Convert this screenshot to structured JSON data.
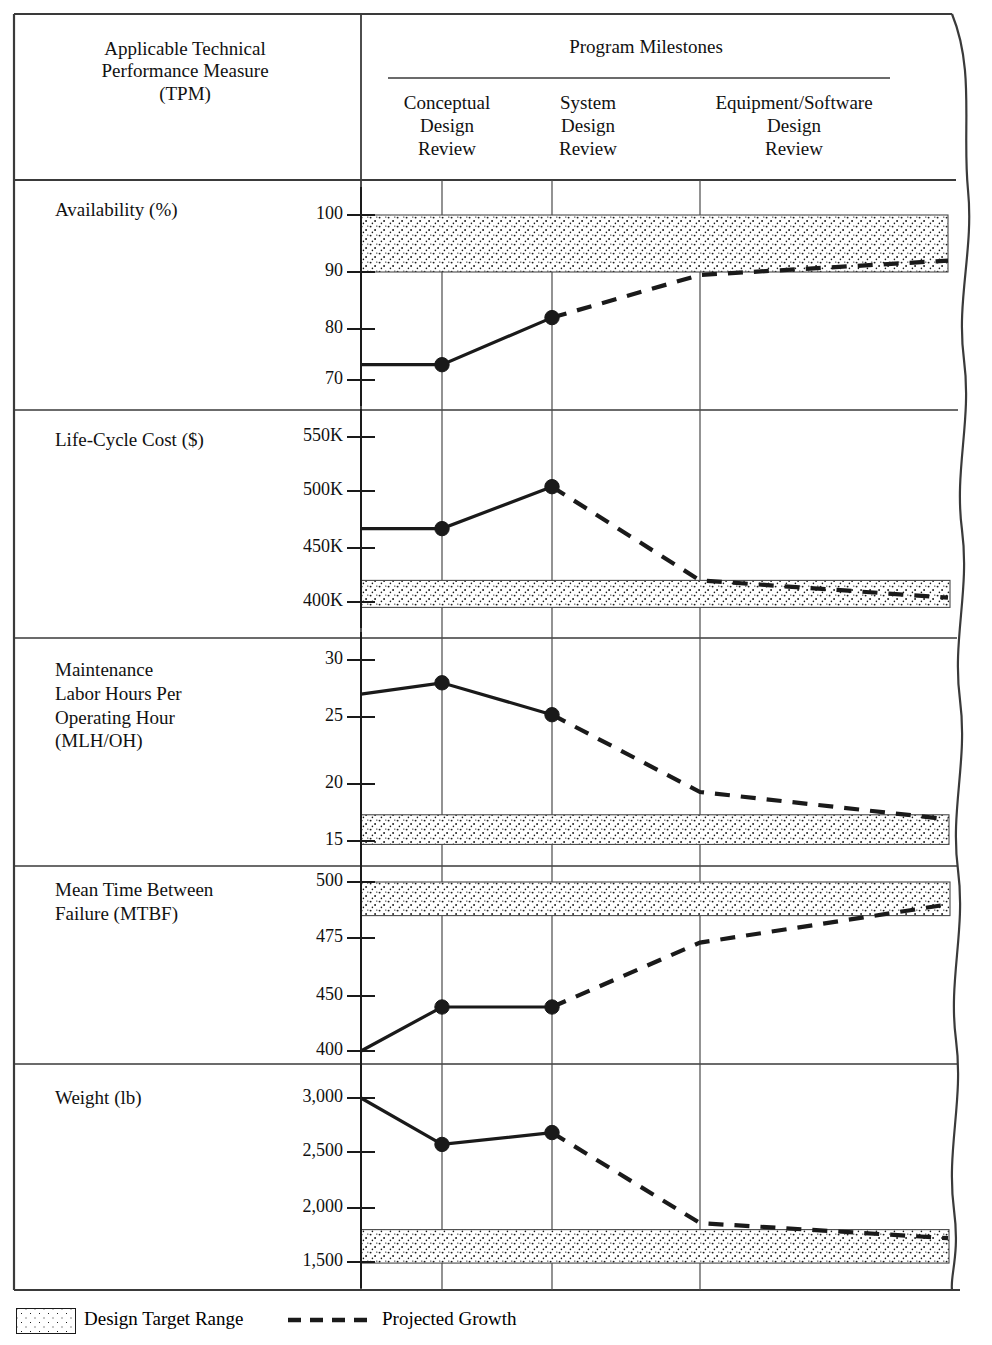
{
  "header": {
    "tpm_title": "Applicable Technical\nPerformance Measure\n(TPM)",
    "program_title": "Program Milestones",
    "milestones": [
      {
        "label": "Conceptual\nDesign\nReview",
        "short": "CDR"
      },
      {
        "label": "System\nDesign\nReview",
        "short": "SDR"
      },
      {
        "label": "Equipment/Software\nDesign\nReview",
        "short": "ESDR"
      }
    ]
  },
  "legend": {
    "target_range_label": "Design Target Range",
    "projected_growth_label": "Projected Growth",
    "swatch_icon": "stipple-swatch-icon",
    "dash_icon": "dashed-line-icon"
  },
  "colors": {
    "ink": "#1a1a1a",
    "rule": "#3a3a3a",
    "stipple": "#1a1a1a",
    "paper": "#ffffff"
  },
  "chart_data": [
    {
      "id": "availability",
      "type": "line",
      "title": "Availability (%)",
      "ylabel": "Availability (%)",
      "xlabel": "",
      "tick_labels": [
        "100",
        "90",
        "80",
        "70"
      ],
      "tick_values": [
        100,
        90,
        80,
        70
      ],
      "ylim": [
        66,
        103
      ],
      "target_range": [
        90,
        100
      ],
      "grid": true,
      "legend_position": "below-figure",
      "categories": [
        "start",
        "Conceptual Design Review",
        "System Design Review",
        "Equipment/Software Design Review",
        "end"
      ],
      "series": [
        {
          "name": "Achieved",
          "style": "solid",
          "values": [
            73,
            73,
            82,
            null,
            null
          ]
        },
        {
          "name": "Projected Growth",
          "style": "dashed",
          "values": [
            null,
            null,
            82,
            89.5,
            92
          ]
        }
      ],
      "markers_at": [
        "Conceptual Design Review",
        "System Design Review"
      ]
    },
    {
      "id": "life-cycle-cost",
      "type": "line",
      "title": "Life-Cycle Cost ($)",
      "ylabel": "Life-Cycle Cost ($)",
      "xlabel": "",
      "tick_labels": [
        "550K",
        "500K",
        "450K",
        "400K"
      ],
      "tick_values": [
        550000,
        500000,
        450000,
        400000
      ],
      "ylim": [
        385000,
        565000
      ],
      "target_range": [
        395000,
        420000
      ],
      "grid": true,
      "legend_position": "below-figure",
      "categories": [
        "start",
        "Conceptual Design Review",
        "System Design Review",
        "Equipment/Software Design Review",
        "end"
      ],
      "series": [
        {
          "name": "Achieved",
          "style": "solid",
          "values": [
            467000,
            467000,
            504000,
            null,
            null
          ]
        },
        {
          "name": "Projected Growth",
          "style": "dashed",
          "values": [
            null,
            null,
            504000,
            420000,
            404000
          ]
        }
      ],
      "markers_at": [
        "Conceptual Design Review",
        "System Design Review"
      ]
    },
    {
      "id": "maintenance-labor-hours",
      "type": "line",
      "title": "Maintenance Labor Hours Per Operating Hour (MLH/OH)",
      "ylabel": "Maintenance\nLabor Hours Per\nOperating Hour\n(MLH/OH)",
      "xlabel": "",
      "tick_labels": [
        "30",
        "25",
        "20",
        "15"
      ],
      "tick_values": [
        30,
        25,
        20,
        15
      ],
      "ylim": [
        13.5,
        31.5
      ],
      "target_range": [
        14.7,
        17.3
      ],
      "grid": true,
      "legend_position": "below-figure",
      "categories": [
        "start",
        "Conceptual Design Review",
        "System Design Review",
        "Equipment/Software Design Review",
        "end"
      ],
      "series": [
        {
          "name": "Achieved",
          "style": "solid",
          "values": [
            27.0,
            28.0,
            25.2,
            null,
            null
          ]
        },
        {
          "name": "Projected Growth",
          "style": "dashed",
          "values": [
            null,
            null,
            25.2,
            19.3,
            16.9
          ]
        }
      ],
      "markers_at": [
        "Conceptual Design Review",
        "System Design Review"
      ]
    },
    {
      "id": "mtbf",
      "type": "line",
      "title": "Mean Time Between Failure (MTBF)",
      "ylabel": "Mean Time Between\nFailure (MTBF)",
      "xlabel": "",
      "tick_labels": [
        "500",
        "475",
        "450",
        "400"
      ],
      "tick_values": [
        500,
        475,
        450,
        400
      ],
      "ylim": [
        392,
        508
      ],
      "target_range": [
        485,
        500
      ],
      "grid": true,
      "legend_position": "below-figure",
      "categories": [
        "start",
        "Conceptual Design Review",
        "System Design Review",
        "Equipment/Software Design Review",
        "end"
      ],
      "series": [
        {
          "name": "Achieved",
          "style": "solid",
          "values": [
            400,
            440,
            440,
            null,
            null
          ]
        },
        {
          "name": "Projected Growth",
          "style": "dashed",
          "values": [
            null,
            null,
            440,
            473,
            490
          ]
        }
      ],
      "markers_at": [
        "Conceptual Design Review",
        "System Design Review"
      ]
    },
    {
      "id": "weight",
      "type": "line",
      "title": "Weight (lb)",
      "ylabel": "Weight (lb)",
      "xlabel": "",
      "tick_labels": [
        "3,000",
        "2,500",
        "2,000",
        "1,500"
      ],
      "tick_values": [
        3000,
        2500,
        2000,
        1500
      ],
      "ylim": [
        1420,
        3080
      ],
      "target_range": [
        1490,
        1800
      ],
      "grid": true,
      "legend_position": "below-figure",
      "categories": [
        "start",
        "Conceptual Design Review",
        "System Design Review",
        "Equipment/Software Design Review",
        "end"
      ],
      "series": [
        {
          "name": "Achieved",
          "style": "solid",
          "values": [
            3000,
            2570,
            2680,
            null,
            null
          ]
        },
        {
          "name": "Projected Growth",
          "style": "dashed",
          "values": [
            null,
            null,
            2680,
            1860,
            1720
          ]
        }
      ],
      "markers_at": [
        "Conceptual Design Review",
        "System Design Review"
      ]
    }
  ]
}
